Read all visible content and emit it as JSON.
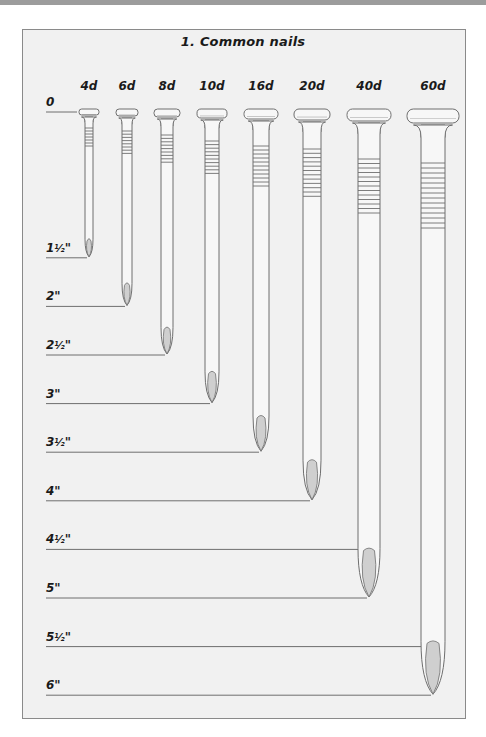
{
  "header": {
    "bar_color": "#9c9c9c"
  },
  "figure": {
    "title": "1. Common nails",
    "frame": {
      "x": 22,
      "y": 29,
      "width": 444,
      "height": 690,
      "fill": "#f1f1f1",
      "stroke": "#8a8a8a"
    },
    "colors": {
      "line": "#6e6e6e",
      "nail_fill": "#f7f7f7",
      "tip_fill": "#cfcfcf",
      "text": "#1a1a1a"
    },
    "scale": {
      "zero_y": 111,
      "pixels_per_half_inch": 48.6,
      "label_x": 46,
      "line_x_start": 46,
      "marks": [
        {
          "label": "0",
          "whole": "0",
          "frac": "",
          "inches": 0
        },
        {
          "label": "1½\"",
          "whole": "1",
          "frac": "½",
          "inches": 1.5
        },
        {
          "label": "2\"",
          "whole": "2",
          "frac": "",
          "inches": 2
        },
        {
          "label": "2½\"",
          "whole": "2",
          "frac": "½",
          "inches": 2.5
        },
        {
          "label": "3\"",
          "whole": "3",
          "frac": "",
          "inches": 3
        },
        {
          "label": "3½\"",
          "whole": "3",
          "frac": "½",
          "inches": 3.5
        },
        {
          "label": "4\"",
          "whole": "4",
          "frac": "",
          "inches": 4
        },
        {
          "label": "4½\"",
          "whole": "4",
          "frac": "½",
          "inches": 4.5
        },
        {
          "label": "5\"",
          "whole": "5",
          "frac": "",
          "inches": 5
        },
        {
          "label": "5½\"",
          "whole": "5",
          "frac": "½",
          "inches": 5.5
        },
        {
          "label": "6\"",
          "whole": "6",
          "frac": "",
          "inches": 6
        }
      ]
    },
    "nails": [
      {
        "size": "4d",
        "length_in": 1.5,
        "cx": 89,
        "head_w": 20,
        "head_h": 6,
        "shank_w": 8,
        "rings": 7,
        "ring_start": 17,
        "ring_gap": 3.0
      },
      {
        "size": "6d",
        "length_in": 2.0,
        "cx": 127,
        "head_w": 22,
        "head_h": 7,
        "shank_w": 10,
        "rings": 8,
        "ring_start": 20,
        "ring_gap": 3.2
      },
      {
        "size": "8d",
        "length_in": 2.5,
        "cx": 167,
        "head_w": 26,
        "head_h": 8,
        "shank_w": 12,
        "rings": 9,
        "ring_start": 24,
        "ring_gap": 3.4
      },
      {
        "size": "10d",
        "length_in": 3.0,
        "cx": 212,
        "head_w": 30,
        "head_h": 9,
        "shank_w": 14,
        "rings": 10,
        "ring_start": 30,
        "ring_gap": 3.6
      },
      {
        "size": "16d",
        "length_in": 3.5,
        "cx": 261,
        "head_w": 34,
        "head_h": 10,
        "shank_w": 16,
        "rings": 11,
        "ring_start": 35,
        "ring_gap": 4.0
      },
      {
        "size": "20d",
        "length_in": 4.0,
        "cx": 312,
        "head_w": 36,
        "head_h": 11,
        "shank_w": 18,
        "rings": 12,
        "ring_start": 38,
        "ring_gap": 4.3
      },
      {
        "size": "40d",
        "length_in": 5.0,
        "cx": 369,
        "head_w": 44,
        "head_h": 12,
        "shank_w": 22,
        "rings": 13,
        "ring_start": 48,
        "ring_gap": 4.5
      },
      {
        "size": "60d",
        "length_in": 6.0,
        "cx": 433,
        "head_w": 52,
        "head_h": 14,
        "shank_w": 24,
        "rings": 14,
        "ring_start": 52,
        "ring_gap": 5.0
      }
    ]
  }
}
